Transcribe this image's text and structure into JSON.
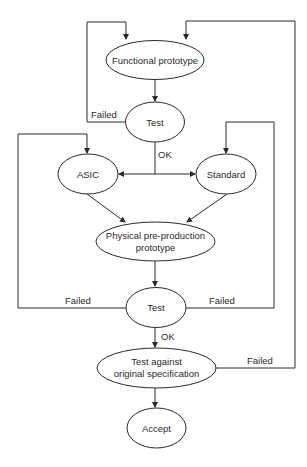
{
  "diagram": {
    "type": "flowchart",
    "colors": {
      "stroke": "#2a2a2a",
      "text": "#2a2a2a",
      "background": "#ffffff"
    },
    "nodes": {
      "functional_prototype": {
        "label": "Functional prototype"
      },
      "test1": {
        "label": "Test"
      },
      "asic": {
        "label": "ASIC"
      },
      "standard": {
        "label": "Standard"
      },
      "physical": {
        "label_line1": "Physical pre-production",
        "label_line2": "prototype"
      },
      "test2": {
        "label": "Test"
      },
      "test_spec": {
        "label_line1": "Test against",
        "label_line2": "original specification"
      },
      "accept": {
        "label": "Accept"
      }
    },
    "edge_labels": {
      "test1_failed": "Failed",
      "test1_ok": "OK",
      "test2_failed_left": "Failed",
      "test2_failed_right": "Failed",
      "test2_ok": "OK",
      "test_spec_failed": "Failed"
    },
    "edges": [
      {
        "from": "Functional prototype",
        "to": "Test"
      },
      {
        "from": "Test",
        "to": "Functional prototype",
        "label": "Failed"
      },
      {
        "from": "Test",
        "to": "ASIC",
        "label": "OK"
      },
      {
        "from": "Test",
        "to": "Standard",
        "label": "OK"
      },
      {
        "from": "ASIC",
        "to": "Physical pre-production prototype"
      },
      {
        "from": "Standard",
        "to": "Physical pre-production prototype"
      },
      {
        "from": "Physical pre-production prototype",
        "to": "Test"
      },
      {
        "from": "Test",
        "to": "ASIC",
        "label": "Failed"
      },
      {
        "from": "Test",
        "to": "Standard",
        "label": "Failed"
      },
      {
        "from": "Test",
        "to": "Test against original specification",
        "label": "OK"
      },
      {
        "from": "Test against original specification",
        "to": "Functional prototype",
        "label": "Failed"
      },
      {
        "from": "Test against original specification",
        "to": "Accept"
      }
    ]
  }
}
